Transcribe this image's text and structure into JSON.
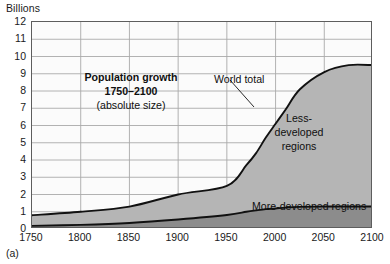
{
  "figure": {
    "caption": "(a)",
    "unit_label": "Billions"
  },
  "annotations": {
    "title_line1": "Population growth",
    "title_line2": "1750–2100",
    "title_line3": "(absolute size)",
    "world_total": "World total",
    "less_developed_line1": "Less-",
    "less_developed_line2": "developed",
    "less_developed_line3": "regions",
    "more_developed": "More-developed regions"
  },
  "colors": {
    "less_developed_fill": "#b5b5b5",
    "more_developed_fill": "#8c8c8c",
    "line": "#111111",
    "grid": "#a9a9a9",
    "frame": "#5d5d5d",
    "plot_background": "#fbfbfb"
  },
  "chart_data": {
    "type": "area",
    "title": "Population growth 1750–2100 (absolute size)",
    "xlabel": "",
    "ylabel": "Billions",
    "xlim": [
      1750,
      2100
    ],
    "ylim": [
      0,
      12
    ],
    "grid": true,
    "legend": "in-plot labels",
    "xticks": [
      1750,
      1800,
      1850,
      1900,
      1950,
      2000,
      2050,
      2100
    ],
    "yticks": [
      0,
      1,
      2,
      3,
      4,
      5,
      6,
      7,
      8,
      9,
      10,
      11,
      12
    ],
    "x": [
      1750,
      1800,
      1850,
      1900,
      1950,
      1970,
      1980,
      1990,
      2000,
      2010,
      2025,
      2050,
      2075,
      2100
    ],
    "series": [
      {
        "name": "More-developed regions",
        "stacked": true,
        "values": [
          0.18,
          0.24,
          0.35,
          0.55,
          0.81,
          1.0,
          1.08,
          1.15,
          1.19,
          1.24,
          1.28,
          1.3,
          1.3,
          1.3
        ]
      },
      {
        "name": "Less-developed regions",
        "stacked": true,
        "values": [
          0.62,
          0.76,
          0.95,
          1.45,
          1.9,
          2.7,
          3.3,
          4.1,
          4.9,
          5.7,
          6.8,
          7.8,
          8.2,
          8.2
        ]
      }
    ],
    "total_series": {
      "name": "World total",
      "values": [
        0.8,
        1.0,
        1.3,
        2.0,
        2.5,
        3.7,
        4.4,
        5.3,
        6.1,
        6.9,
        8.1,
        9.1,
        9.5,
        9.5
      ]
    }
  }
}
